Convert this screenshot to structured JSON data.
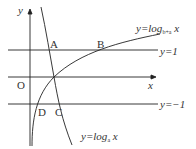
{
  "diagram": {
    "axes": {
      "x_label": "x",
      "y_label": "y",
      "origin_label": "O"
    },
    "lines": [
      {
        "label": "y=1",
        "y": 1
      },
      {
        "label": "y=−1",
        "y": -1
      }
    ],
    "curves": [
      {
        "label_prefix": "y=log",
        "subscript": "b+a",
        "var": "x",
        "kind": "increasing"
      },
      {
        "label_prefix": "y=log",
        "subscript": "a",
        "var": "x",
        "kind": "decreasing"
      }
    ],
    "points": [
      "A",
      "B",
      "C",
      "D"
    ],
    "colors": {
      "stroke": "#222222",
      "text": "#333333"
    }
  }
}
